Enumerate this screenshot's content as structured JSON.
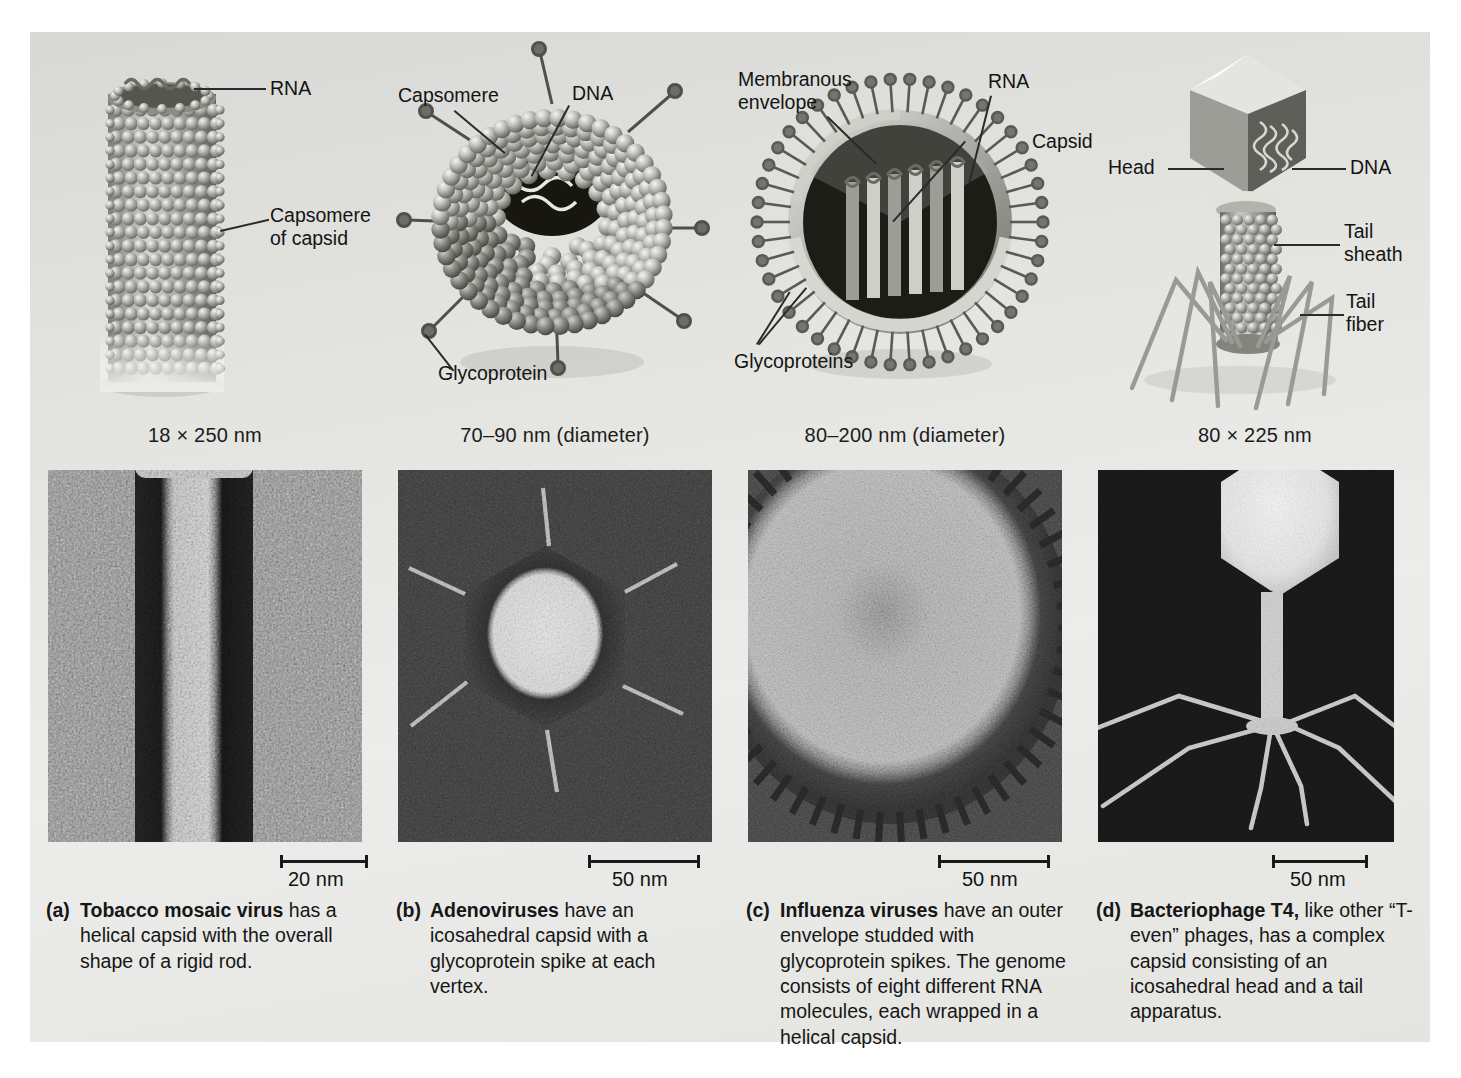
{
  "figure": {
    "background_color": "#e6e6e3",
    "panels": [
      {
        "id": "a",
        "size_label": "18 × 250 nm",
        "art_labels": [
          {
            "name": "rna",
            "text": "RNA"
          },
          {
            "name": "capsomere-of-capsid",
            "text": "Capsomere\nof capsid"
          }
        ],
        "scale_bar": "20 nm",
        "caption_marker": "(a)",
        "caption_term": "Tobacco mosaic virus",
        "caption_body": " has a helical capsid with the overall shape of a rigid rod."
      },
      {
        "id": "b",
        "size_label": "70–90 nm (diameter)",
        "art_labels": [
          {
            "name": "capsomere",
            "text": "Capsomere"
          },
          {
            "name": "dna",
            "text": "DNA"
          },
          {
            "name": "glycoprotein",
            "text": "Glycoprotein"
          }
        ],
        "scale_bar": "50 nm",
        "caption_marker": "(b)",
        "caption_term": "Adenoviruses",
        "caption_body": " have an icosahedral capsid with a glycoprotein spike at each vertex."
      },
      {
        "id": "c",
        "size_label": "80–200 nm (diameter)",
        "art_labels": [
          {
            "name": "membranous-envelope",
            "text": "Membranous\nenvelope"
          },
          {
            "name": "rna",
            "text": "RNA"
          },
          {
            "name": "capsid",
            "text": "Capsid"
          },
          {
            "name": "glycoproteins",
            "text": "Glycoproteins"
          }
        ],
        "scale_bar": "50 nm",
        "caption_marker": "(c)",
        "caption_term": "Influenza viruses",
        "caption_body": " have an outer envelope studded with glycoprotein spikes. The genome consists of eight different RNA molecules, each wrapped in a helical capsid."
      },
      {
        "id": "d",
        "size_label": "80 × 225 nm",
        "art_labels": [
          {
            "name": "head",
            "text": "Head"
          },
          {
            "name": "dna",
            "text": "DNA"
          },
          {
            "name": "tail-sheath",
            "text": "Tail\nsheath"
          },
          {
            "name": "tail-fiber",
            "text": "Tail\nfiber"
          }
        ],
        "scale_bar": "50 nm",
        "caption_marker": "(d)",
        "caption_term": "Bacteriophage T4,",
        "caption_body": " like other “T-even” phages, has a complex capsid consisting of an icosahedral head and a tail apparatus."
      }
    ]
  }
}
